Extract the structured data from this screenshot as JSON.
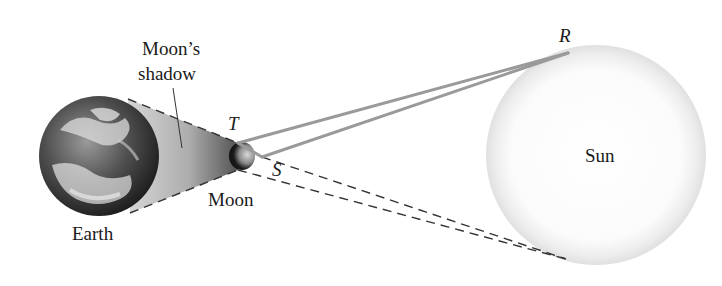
{
  "diagram": {
    "type": "solar-eclipse-geometry",
    "labels": {
      "earth": "Earth",
      "moon": "Moon",
      "sun": "Sun",
      "shadow_line1": "Moon’s",
      "shadow_line2": "shadow",
      "point_t": "T",
      "point_s": "S",
      "point_r": "R"
    },
    "colors": {
      "solid_lines": "#9a9a9a",
      "dashed_lines": "#333333",
      "sun_fill": "#ffffff",
      "sun_glow": "#e2e2e2",
      "shadow": "#8a8a8a"
    },
    "points": {
      "T": [
        238,
        143
      ],
      "S": [
        262,
        157
      ],
      "R": [
        568,
        53
      ],
      "dash_end": [
        566,
        259
      ]
    }
  }
}
